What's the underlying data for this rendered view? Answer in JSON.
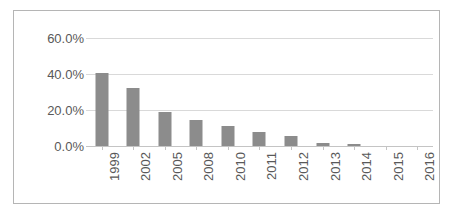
{
  "chart_data": {
    "type": "bar",
    "title": "",
    "subtitle": "",
    "xlabel": "",
    "ylabel": "",
    "categories": [
      "1999",
      "2002",
      "2005",
      "2008",
      "2010",
      "2011",
      "2012",
      "2013",
      "2014",
      "2015",
      "2016"
    ],
    "values": [
      40.5,
      32.0,
      19.0,
      14.5,
      11.0,
      7.8,
      5.6,
      1.5,
      1.2,
      0.0,
      0.0
    ],
    "value_labels": [
      "40.5%",
      "32.0%",
      "19.0%",
      "14.5%",
      "11.0%",
      "7.8%",
      "5.6%",
      "1.5%",
      "1.2%",
      "0.0%",
      "0.0%"
    ],
    "ylim": [
      0,
      60
    ],
    "ytick_values": [
      60,
      40,
      20,
      0
    ],
    "ytick_labels": [
      "60.0%",
      "40.0%",
      "20.0%",
      "0.0%"
    ],
    "grid": true,
    "grid_axis": "y",
    "legend": false,
    "legend_position": "none",
    "bar_color": "#8c8c8c",
    "gridline_color": "#d9d9d9",
    "axis_color": "#c4c4c4",
    "text_color": "#595959",
    "border_color": "#b5b5b5",
    "background_color": "#ffffff",
    "xtick_label_rotation": -90,
    "annotations": []
  }
}
